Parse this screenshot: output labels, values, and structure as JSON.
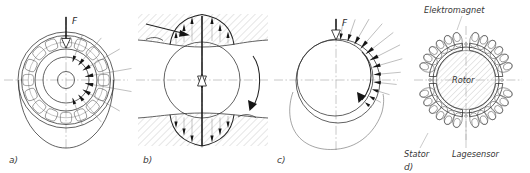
{
  "figure": {
    "background_color": "#ffffff",
    "line_color": "#2e2e2e",
    "axis_color": "#9a9a9a"
  },
  "panels": [
    {
      "id": "a",
      "label": "a)",
      "name": "rolling-element-bearing",
      "force_label": "F",
      "description": "Roller bearing cross-section with load distribution"
    },
    {
      "id": "b",
      "label": "b)",
      "name": "hydrostatic-bearing",
      "description": "Journal between hatched surfaces with pressure distribution"
    },
    {
      "id": "c",
      "label": "c)",
      "name": "hydrodynamic-journal-bearing",
      "force_label": "F",
      "description": "Eccentric journal in bearing shell with pressure wedge"
    },
    {
      "id": "d",
      "label": "d)",
      "name": "active-magnetic-bearing",
      "description": "Magnetic bearing cross-section with rotor, stator and coils",
      "callouts": [
        {
          "name": "elektromagnet",
          "text": "Elektromagnet"
        },
        {
          "name": "rotor",
          "text": "Rotor"
        },
        {
          "name": "stator",
          "text": "Stator"
        },
        {
          "name": "lagesensor",
          "text": "Lagesensor"
        }
      ]
    }
  ]
}
